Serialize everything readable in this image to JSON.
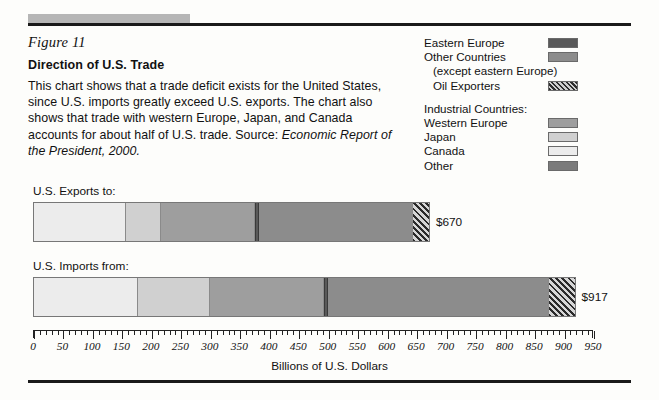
{
  "figure": {
    "label": "Figure 11",
    "title": "Direction of U.S. Trade",
    "description": "This chart shows that a trade deficit exists for the United States, since U.S. imports greatly exceed U.S. exports. The chart also shows that trade with western Europe, Japan, and Canada accounts for about half of U.S. trade. Source: ",
    "source": "Economic Report of the President, 2000."
  },
  "legend": {
    "group_heading": "Industrial Countries:",
    "items": [
      {
        "label": "Eastern Europe",
        "swatch": "solid",
        "color": "#595959"
      },
      {
        "label": "Other Countries",
        "swatch": "solid",
        "color": "#8c8c8c"
      },
      {
        "label": "(except eastern Europe)",
        "swatch": "none",
        "color": ""
      },
      {
        "label": "Oil Exporters",
        "swatch": "hatch",
        "color": "#7a7a7a"
      },
      {
        "label": "Western Europe",
        "swatch": "solid",
        "color": "#9e9e9e"
      },
      {
        "label": "Japan",
        "swatch": "solid",
        "color": "#d0d0d0"
      },
      {
        "label": "Canada",
        "swatch": "solid",
        "color": "#ececec"
      },
      {
        "label": "Other",
        "swatch": "solid",
        "color": "#7b7b7b"
      }
    ]
  },
  "chart_data": {
    "type": "bar",
    "orientation": "horizontal",
    "title": "Direction of U.S. Trade",
    "xlabel": "Billions of U.S. Dollars",
    "ylabel": "",
    "xlim": [
      0,
      950
    ],
    "x_major_ticks": [
      0,
      50,
      100,
      150,
      200,
      250,
      300,
      350,
      400,
      450,
      500,
      550,
      600,
      650,
      700,
      750,
      800,
      850,
      900,
      950
    ],
    "x_minor_step": 10,
    "grid": false,
    "legend_position": "top-right",
    "units": "billions of U.S. dollars",
    "categories": [
      "U.S. Exports to:",
      "U.S. Imports from:"
    ],
    "totals": [
      670,
      917
    ],
    "total_labels": [
      "$670",
      "$917"
    ],
    "series": [
      {
        "name": "Canada",
        "swatch": "solid",
        "color": "#ececec",
        "values": [
          156,
          177
        ]
      },
      {
        "name": "Japan",
        "swatch": "solid",
        "color": "#d0d0d0",
        "values": [
          59,
          122
        ]
      },
      {
        "name": "Western Europe",
        "swatch": "solid",
        "color": "#9e9e9e",
        "values": [
          160,
          193
        ]
      },
      {
        "name": "Eastern Europe",
        "swatch": "solid",
        "color": "#595959",
        "values": [
          7,
          7
        ]
      },
      {
        "name": "Other Countries",
        "swatch": "solid",
        "color": "#8c8c8c",
        "values": [
          261,
          375
        ]
      },
      {
        "name": "Oil Exporters",
        "swatch": "hatch",
        "color": "#7a7a7a",
        "values": [
          27,
          43
        ]
      }
    ]
  }
}
